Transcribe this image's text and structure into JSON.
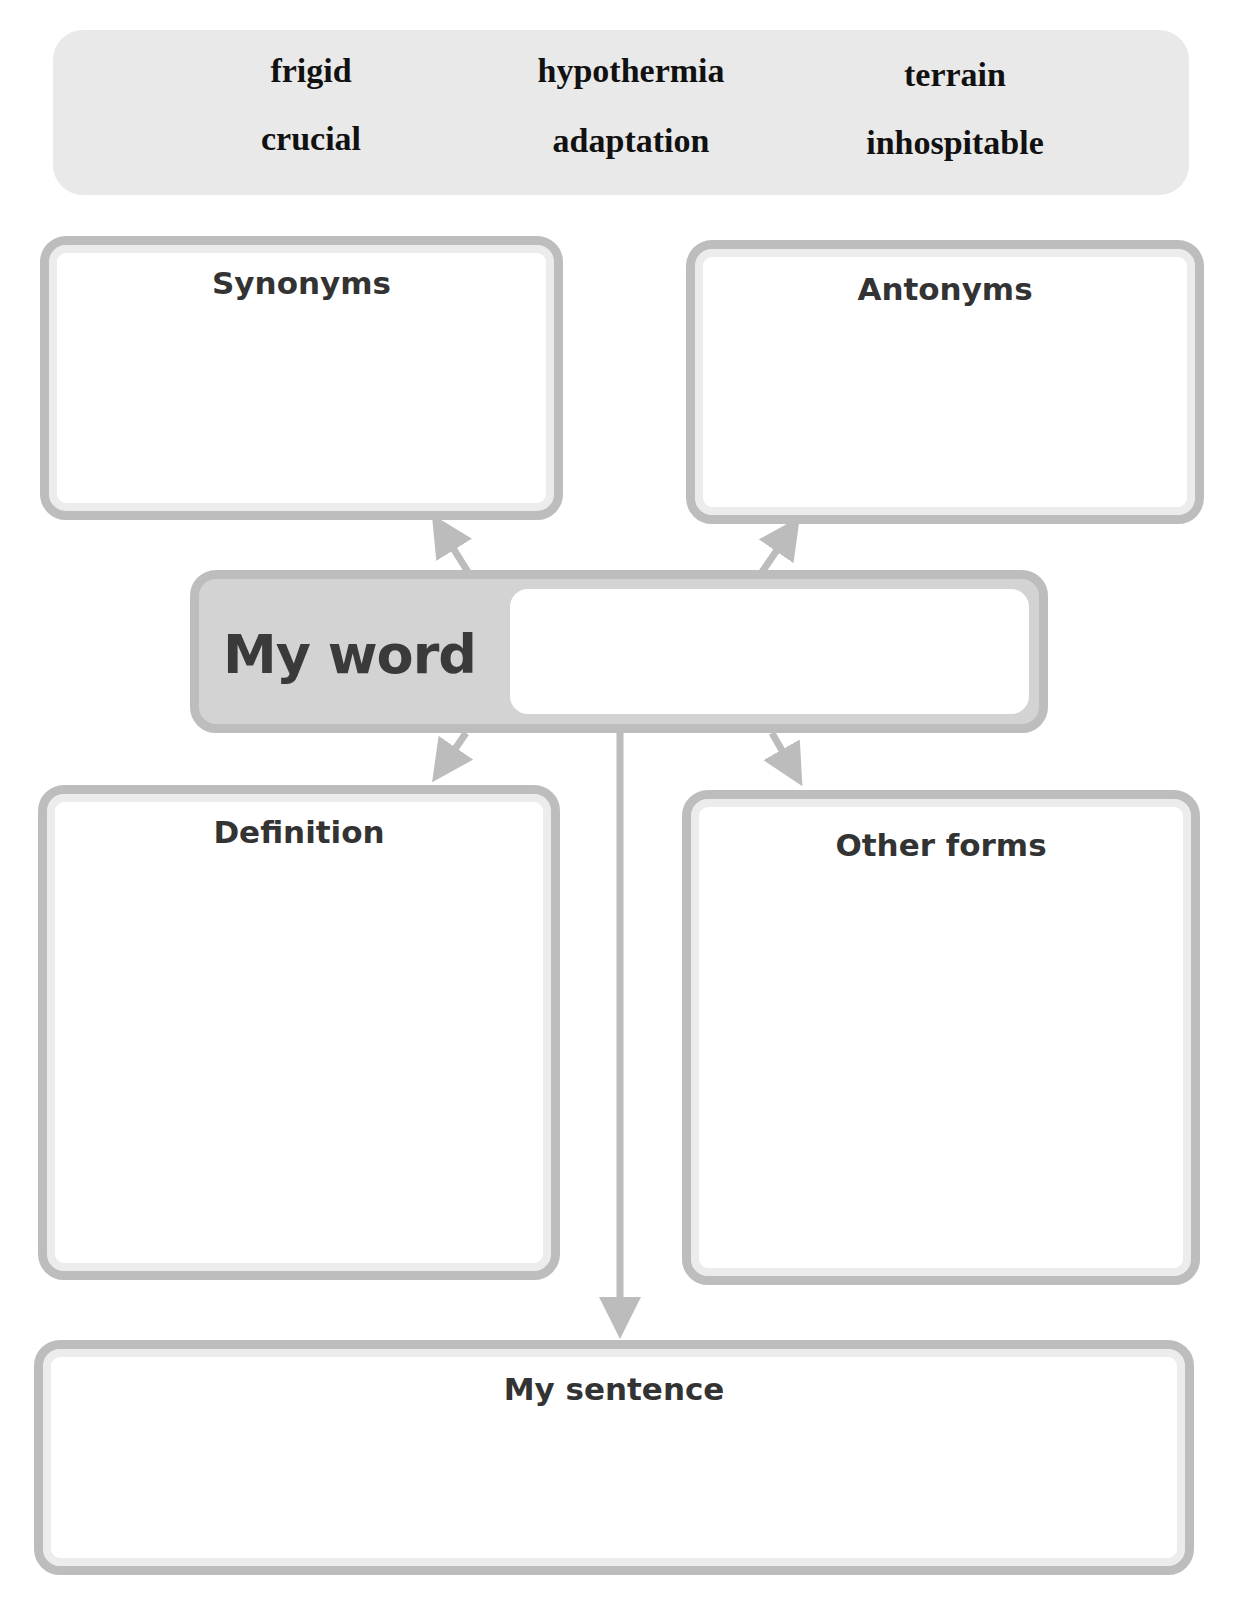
{
  "word_bank": {
    "words": [
      {
        "text": "frigid"
      },
      {
        "text": "hypothermia"
      },
      {
        "text": "terrain"
      },
      {
        "text": "crucial"
      },
      {
        "text": "adaptation"
      },
      {
        "text": "inhospitable"
      }
    ]
  },
  "boxes": {
    "synonyms": {
      "title": "Synonyms",
      "value": ""
    },
    "antonyms": {
      "title": "Antonyms",
      "value": ""
    },
    "definition": {
      "title": "Definition",
      "value": ""
    },
    "other_forms": {
      "title": "Other forms",
      "value": ""
    },
    "my_sentence": {
      "title": "My sentence",
      "value": ""
    }
  },
  "my_word": {
    "label": "My word",
    "value": ""
  },
  "colors": {
    "box_border": "#bdbdbd",
    "word_bank_bg": "#e9e9e9",
    "my_word_bg": "#d3d3d3",
    "arrow": "#bcbcbc"
  }
}
